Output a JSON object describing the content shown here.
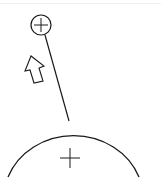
{
  "diagram": {
    "small_charge": {
      "sign": "+",
      "label": "small-positive-charge"
    },
    "large_body": {
      "sign": "+",
      "label": "large-positive-body"
    },
    "thread": {
      "label": "suspension-thread"
    },
    "arrow": {
      "label": "force-direction-arrow",
      "direction": "up-left"
    },
    "colors": {
      "stroke": "#1a1a1a",
      "background": "#ffffff"
    }
  }
}
